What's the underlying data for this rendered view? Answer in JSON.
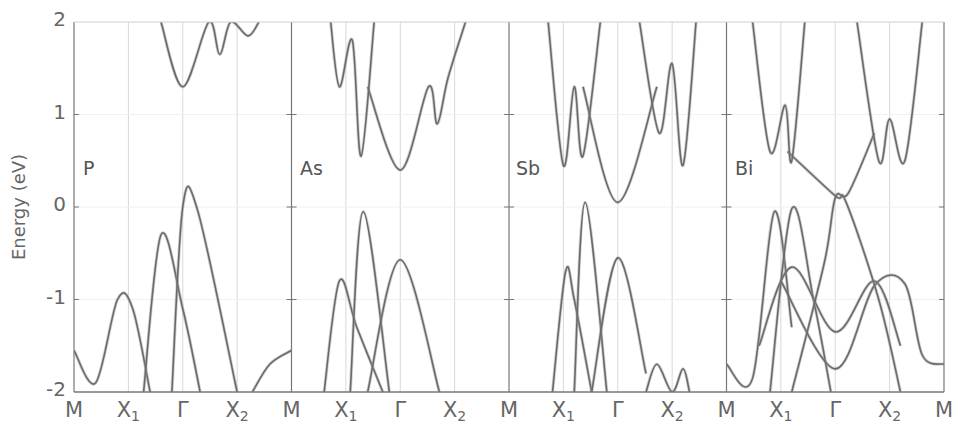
{
  "chart_data": {
    "type": "line",
    "title": "",
    "xlabel": "",
    "ylabel": "Energy (eV)",
    "ylim": [
      -2,
      2
    ],
    "yticks": [
      "2",
      "1",
      "0",
      "-1",
      "-2"
    ],
    "grid": "vertical lines at high-symmetry points",
    "legend": "none",
    "high_symmetry_path": [
      "M",
      "X1",
      "Γ",
      "X2",
      "M"
    ],
    "panels": [
      {
        "name": "P",
        "bands": [
          {
            "name": "valence-top",
            "points": [
              [
                0,
                -1.55
              ],
              [
                0.1,
                -1.9
              ],
              [
                0.2,
                -1.0
              ],
              [
                0.27,
                -1.1
              ],
              [
                0.35,
                -2.0
              ]
            ]
          },
          {
            "name": "valence-X1",
            "points": [
              [
                0.32,
                -2.0
              ],
              [
                0.4,
                -0.3
              ],
              [
                0.5,
                -1.1
              ],
              [
                0.58,
                -2.0
              ]
            ]
          },
          {
            "name": "valence-Gamma",
            "points": [
              [
                0.45,
                -2.0
              ],
              [
                0.5,
                0.0
              ],
              [
                0.57,
                -0.05
              ],
              [
                0.75,
                -2.0
              ]
            ]
          },
          {
            "name": "valence-M-right",
            "points": [
              [
                0.82,
                -2.0
              ],
              [
                0.9,
                -1.7
              ],
              [
                1.0,
                -1.55
              ]
            ]
          },
          {
            "name": "conduction-Gamma",
            "points": [
              [
                0.4,
                2.0
              ],
              [
                0.5,
                1.3
              ],
              [
                0.62,
                2.0
              ],
              [
                0.67,
                1.65
              ],
              [
                0.72,
                2.0
              ],
              [
                0.8,
                1.85
              ],
              [
                0.85,
                2.0
              ]
            ]
          }
        ]
      },
      {
        "name": "As",
        "bands": [
          {
            "name": "valence-X1a",
            "points": [
              [
                0.15,
                -2.0
              ],
              [
                0.22,
                -0.8
              ],
              [
                0.3,
                -1.3
              ],
              [
                0.42,
                -2.0
              ]
            ]
          },
          {
            "name": "valence-X1b",
            "points": [
              [
                0.27,
                -2.0
              ],
              [
                0.33,
                -0.05
              ],
              [
                0.45,
                -2.0
              ]
            ]
          },
          {
            "name": "valence-Gamma",
            "points": [
              [
                0.35,
                -2.0
              ],
              [
                0.5,
                -0.57
              ],
              [
                0.68,
                -2.0
              ]
            ]
          },
          {
            "name": "conduction-Gamma",
            "points": [
              [
                0.35,
                1.3
              ],
              [
                0.5,
                0.4
              ],
              [
                0.63,
                1.3
              ],
              [
                0.67,
                0.9
              ],
              [
                0.72,
                1.4
              ],
              [
                0.8,
                2.0
              ]
            ]
          },
          {
            "name": "conduction-X1",
            "points": [
              [
                0.18,
                2.0
              ],
              [
                0.22,
                1.3
              ],
              [
                0.28,
                1.8
              ],
              [
                0.32,
                0.55
              ],
              [
                0.38,
                2.0
              ]
            ]
          }
        ]
      },
      {
        "name": "Sb",
        "bands": [
          {
            "name": "valence-X1a",
            "points": [
              [
                0.2,
                -2.0
              ],
              [
                0.26,
                -0.7
              ],
              [
                0.3,
                -1.0
              ],
              [
                0.38,
                -2.0
              ]
            ]
          },
          {
            "name": "valence-X1b",
            "points": [
              [
                0.3,
                -2.0
              ],
              [
                0.35,
                0.05
              ],
              [
                0.45,
                -2.0
              ]
            ]
          },
          {
            "name": "valence-Gamma",
            "points": [
              [
                0.38,
                -2.0
              ],
              [
                0.5,
                -0.55
              ],
              [
                0.63,
                -1.8
              ]
            ]
          },
          {
            "name": "valence-X2-pockets",
            "points": [
              [
                0.63,
                -2.0
              ],
              [
                0.68,
                -1.7
              ],
              [
                0.75,
                -2.0
              ],
              [
                0.8,
                -1.75
              ],
              [
                0.83,
                -2.0
              ]
            ]
          },
          {
            "name": "conduction-Gamma",
            "points": [
              [
                0.34,
                1.3
              ],
              [
                0.5,
                0.05
              ],
              [
                0.68,
                1.3
              ]
            ]
          },
          {
            "name": "conduction-X1",
            "points": [
              [
                0.18,
                2.0
              ],
              [
                0.25,
                0.45
              ],
              [
                0.3,
                1.3
              ],
              [
                0.34,
                0.55
              ],
              [
                0.42,
                2.0
              ]
            ]
          },
          {
            "name": "conduction-X2",
            "points": [
              [
                0.6,
                2.0
              ],
              [
                0.69,
                0.8
              ],
              [
                0.75,
                1.55
              ],
              [
                0.8,
                0.45
              ],
              [
                0.86,
                2.0
              ]
            ]
          }
        ]
      },
      {
        "name": "Bi",
        "bands": [
          {
            "name": "valence-M-left",
            "points": [
              [
                0.0,
                -1.7
              ],
              [
                0.12,
                -1.85
              ],
              [
                0.22,
                -0.05
              ],
              [
                0.3,
                -1.3
              ]
            ]
          },
          {
            "name": "valence-X1",
            "points": [
              [
                0.2,
                -2.0
              ],
              [
                0.3,
                -0.02
              ],
              [
                0.4,
                -1.0
              ],
              [
                0.48,
                -2.0
              ]
            ]
          },
          {
            "name": "valence-X1-wide",
            "points": [
              [
                0.15,
                -1.5
              ],
              [
                0.3,
                -0.65
              ],
              [
                0.5,
                -1.35
              ],
              [
                0.68,
                -0.8
              ],
              [
                0.8,
                -1.5
              ]
            ]
          },
          {
            "name": "valence-Gamma-dip",
            "points": [
              [
                0.25,
                -0.8
              ],
              [
                0.5,
                -1.75
              ],
              [
                0.68,
                -0.85
              ],
              [
                0.82,
                -0.83
              ],
              [
                0.9,
                -1.6
              ],
              [
                1.0,
                -1.7
              ]
            ]
          },
          {
            "name": "surface-crossing",
            "points": [
              [
                0.28,
                0.6
              ],
              [
                0.5,
                0.12
              ],
              [
                0.55,
                0.05
              ],
              [
                0.7,
                -1.0
              ],
              [
                0.8,
                -2.0
              ]
            ]
          },
          {
            "name": "surface-crossing-2",
            "points": [
              [
                0.3,
                -2.0
              ],
              [
                0.45,
                -0.6
              ],
              [
                0.5,
                0.1
              ],
              [
                0.56,
                0.15
              ],
              [
                0.68,
                0.8
              ]
            ]
          },
          {
            "name": "conduction-X1",
            "points": [
              [
                0.12,
                2.0
              ],
              [
                0.2,
                0.6
              ],
              [
                0.27,
                1.1
              ],
              [
                0.3,
                0.5
              ],
              [
                0.36,
                2.0
              ]
            ]
          },
          {
            "name": "conduction-X2",
            "points": [
              [
                0.6,
                2.0
              ],
              [
                0.7,
                0.5
              ],
              [
                0.75,
                0.95
              ],
              [
                0.82,
                0.5
              ],
              [
                0.9,
                2.0
              ]
            ]
          }
        ]
      }
    ],
    "annotations": [
      "P",
      "As",
      "Sb",
      "Bi"
    ]
  },
  "axis": {
    "ylabel": "Energy (eV)",
    "yticks": [
      {
        "label": "2",
        "value": 2
      },
      {
        "label": "1",
        "value": 1
      },
      {
        "label": "0",
        "value": 0
      },
      {
        "label": "-1",
        "value": -1
      },
      {
        "label": "-2",
        "value": -2
      }
    ],
    "xticks": [
      {
        "base": "M",
        "sub": ""
      },
      {
        "base": "X",
        "sub": "1"
      },
      {
        "base": "Γ",
        "sub": ""
      },
      {
        "base": "X",
        "sub": "2"
      },
      {
        "base": "M",
        "sub": ""
      },
      {
        "base": "X",
        "sub": "1"
      },
      {
        "base": "Γ",
        "sub": ""
      },
      {
        "base": "X",
        "sub": "2"
      },
      {
        "base": "M",
        "sub": ""
      },
      {
        "base": "X",
        "sub": "1"
      },
      {
        "base": "Γ",
        "sub": ""
      },
      {
        "base": "X",
        "sub": "2"
      },
      {
        "base": "M",
        "sub": ""
      },
      {
        "base": "X",
        "sub": "1"
      },
      {
        "base": "Γ",
        "sub": ""
      },
      {
        "base": "X",
        "sub": "2"
      },
      {
        "base": "M",
        "sub": ""
      }
    ]
  },
  "panel_labels": [
    "P",
    "As",
    "Sb",
    "Bi"
  ],
  "colors": {
    "band": "#6a6a6a",
    "fat_band": "#9a9a9a",
    "frame": "#777777",
    "grid": "#d8d8d8",
    "text": "#666666"
  }
}
